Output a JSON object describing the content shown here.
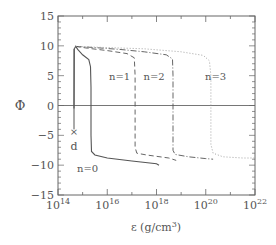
{
  "chart_data": {
    "type": "line",
    "title": "",
    "xlabel": "ε (g/cm³)",
    "xlabel_main": "ε (g/cm",
    "xlabel_sup": "3",
    "xlabel_close": ")",
    "ylabel": "Φ",
    "xscale": "log",
    "xlim_log10": [
      14,
      22
    ],
    "ylim": [
      -15,
      15
    ],
    "x_ticks_log10": [
      14,
      16,
      18,
      20,
      22
    ],
    "x_tick_labels": [
      {
        "base": "10",
        "exp": "14"
      },
      {
        "base": "10",
        "exp": "16"
      },
      {
        "base": "10",
        "exp": "18"
      },
      {
        "base": "10",
        "exp": "20"
      },
      {
        "base": "10",
        "exp": "22"
      }
    ],
    "y_ticks": [
      15,
      10,
      5,
      0,
      -5,
      -10,
      -15
    ],
    "y_tick_labels": [
      "15",
      "10",
      "5",
      "0",
      "−5",
      "−10",
      "−15"
    ],
    "grid": false,
    "zero_line": true,
    "series": [
      {
        "name": "n=0",
        "style": "solid",
        "label": "n=0",
        "label_pos": {
          "log10_eps": 15.2,
          "phi": -10.5
        },
        "points_log10_eps_phi": [
          [
            14.65,
            -0.5
          ],
          [
            14.66,
            9.5
          ],
          [
            14.72,
            9.9
          ],
          [
            14.8,
            9.4
          ],
          [
            15.0,
            8.5
          ],
          [
            15.25,
            7.7
          ],
          [
            15.32,
            6.5
          ],
          [
            15.34,
            3.0
          ],
          [
            15.34,
            -5.0
          ],
          [
            15.36,
            -7.7
          ],
          [
            15.5,
            -8.3
          ],
          [
            16.0,
            -8.8
          ],
          [
            17.0,
            -9.3
          ],
          [
            18.0,
            -9.75
          ],
          [
            18.1,
            -10.0
          ]
        ]
      },
      {
        "name": "n=1",
        "style": "dashed",
        "label": "n=1",
        "label_pos": {
          "log10_eps": 16.5,
          "phi": 5.0
        },
        "points_log10_eps_phi": [
          [
            14.72,
            9.9
          ],
          [
            15.2,
            9.6
          ],
          [
            16.0,
            9.2
          ],
          [
            16.8,
            8.7
          ],
          [
            17.1,
            8.0
          ],
          [
            17.13,
            5.0
          ],
          [
            17.13,
            -7.0
          ],
          [
            17.2,
            -8.0
          ],
          [
            17.6,
            -8.3
          ],
          [
            18.5,
            -8.8
          ],
          [
            18.8,
            -9.2
          ]
        ]
      },
      {
        "name": "n=2",
        "style": "dash-dot",
        "label": "n=2",
        "label_pos": {
          "log10_eps": 17.9,
          "phi": 5.0
        },
        "points_log10_eps_phi": [
          [
            14.72,
            9.9
          ],
          [
            15.5,
            9.7
          ],
          [
            16.5,
            9.4
          ],
          [
            17.5,
            9.0
          ],
          [
            18.4,
            8.5
          ],
          [
            18.65,
            7.8
          ],
          [
            18.67,
            5.0
          ],
          [
            18.67,
            -7.5
          ],
          [
            18.75,
            -8.2
          ],
          [
            19.3,
            -8.6
          ],
          [
            20.0,
            -8.9
          ],
          [
            20.3,
            -9.0
          ]
        ]
      },
      {
        "name": "n=3",
        "style": "dotted",
        "label": "n=3",
        "label_pos": {
          "log10_eps": 20.4,
          "phi": 5.0
        },
        "points_log10_eps_phi": [
          [
            14.72,
            9.9
          ],
          [
            16.0,
            9.7
          ],
          [
            17.5,
            9.5
          ],
          [
            19.0,
            9.0
          ],
          [
            19.9,
            8.4
          ],
          [
            20.15,
            7.5
          ],
          [
            20.21,
            5.0
          ],
          [
            20.21,
            -6.5
          ],
          [
            20.3,
            -8.0
          ],
          [
            20.7,
            -8.6
          ],
          [
            21.5,
            -8.8
          ],
          [
            22.0,
            -8.8
          ]
        ]
      }
    ],
    "annotations": [
      {
        "type": "vertical-line",
        "label": "d",
        "marker": "×",
        "log10_eps": 14.65,
        "phi_from": 9.5,
        "phi_to": -4.0,
        "marker_phi": -4.3,
        "label_phi": -6.8
      }
    ]
  }
}
